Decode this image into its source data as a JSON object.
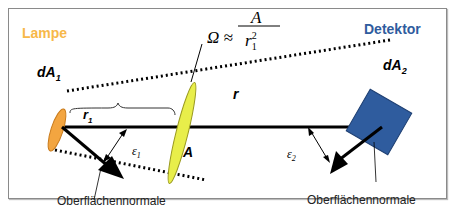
{
  "labels": {
    "lamp": "Lampe",
    "detector": "Detektor",
    "dA1": "dA",
    "dA1_sub": "1",
    "dA2": "dA",
    "dA2_sub": "2",
    "r1": "r",
    "r1_sub": "1",
    "r": "r",
    "A": "A",
    "eps1": "ε",
    "eps1_sub": "1",
    "eps2": "ε",
    "eps2_sub": "2",
    "normal_left": "Oberflächennormale",
    "normal_right": "Oberflächennormale"
  },
  "formula": {
    "lhs": "Ω ≈",
    "numerator": "A",
    "denominator": "r",
    "den_sub": "1",
    "den_sup": "2"
  },
  "colors": {
    "lamp": "#f7b84a",
    "lens": "#e8ee4a",
    "detector": "#2f5c9e",
    "detector_label": "#2f5c9e",
    "line": "#000000"
  }
}
